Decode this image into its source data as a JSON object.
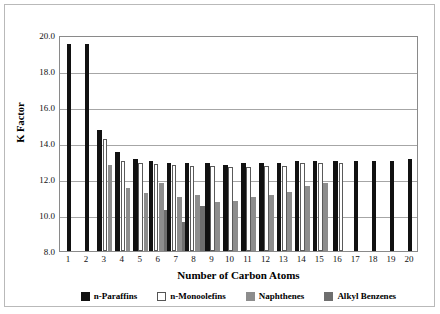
{
  "chart_data": {
    "type": "bar",
    "title": "",
    "xlabel": "Number of Carbon Atoms",
    "ylabel": "K Factor",
    "ylim": [
      8.0,
      20.0
    ],
    "ytick_labels": [
      "20.0",
      "18.0",
      "16.0",
      "14.0",
      "12.0",
      "10.0",
      "8.0"
    ],
    "ytick_values": [
      20.0,
      18.0,
      16.0,
      14.0,
      12.0,
      10.0,
      8.0
    ],
    "grid": true,
    "legend_position": "bottom",
    "categories": [
      "1",
      "2",
      "3",
      "4",
      "5",
      "6",
      "7",
      "8",
      "9",
      "10",
      "11",
      "12",
      "13",
      "14",
      "15",
      "16",
      "17",
      "18",
      "19",
      "20"
    ],
    "series": [
      {
        "name": "n-Paraffins",
        "color": "#111111",
        "values": [
          19.5,
          19.5,
          14.7,
          13.5,
          13.1,
          13.0,
          12.9,
          12.9,
          12.9,
          12.8,
          12.9,
          12.9,
          12.9,
          13.0,
          13.0,
          13.0,
          13.0,
          13.0,
          13.0,
          13.1
        ]
      },
      {
        "name": "n-Monoolefins",
        "color": "#ffffff",
        "values": [
          null,
          null,
          14.25,
          13.0,
          12.9,
          12.85,
          12.8,
          12.75,
          12.7,
          12.65,
          12.65,
          12.7,
          12.75,
          12.9,
          12.9,
          12.9,
          null,
          null,
          null,
          null
        ]
      },
      {
        "name": "Naphthenes",
        "color": "#8d8d8d",
        "values": [
          null,
          null,
          12.8,
          11.5,
          11.2,
          11.8,
          11.0,
          11.1,
          10.7,
          10.8,
          11.0,
          11.1,
          11.3,
          11.6,
          11.8,
          null,
          null,
          null,
          null,
          null
        ]
      },
      {
        "name": "Alkyl Benzenes",
        "color": "#6e6e6e",
        "values": [
          null,
          null,
          null,
          null,
          null,
          10.3,
          9.6,
          10.5,
          null,
          null,
          null,
          null,
          null,
          null,
          null,
          null,
          null,
          null,
          null,
          null
        ]
      }
    ]
  },
  "legend": {
    "items": [
      {
        "label": "n-Paraffins",
        "color": "#111111"
      },
      {
        "label": "n-Monoolefins",
        "color": "#ffffff"
      },
      {
        "label": "Naphthenes",
        "color": "#8d8d8d"
      },
      {
        "label": "Alkyl Benzenes",
        "color": "#6e6e6e"
      }
    ]
  }
}
